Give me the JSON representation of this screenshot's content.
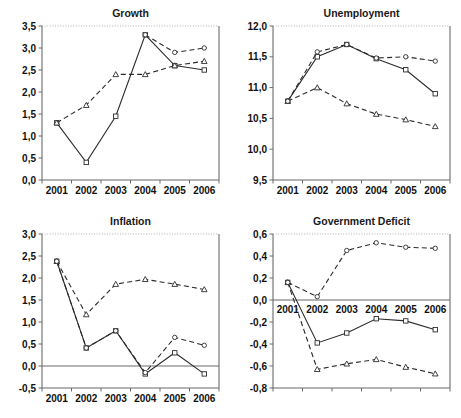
{
  "figure": {
    "background": "#ffffff",
    "line_color": "#2b2b2b",
    "axis_color": "#6b6b6b",
    "decimal_separator": ",",
    "layout": "2x2 grid of line charts"
  },
  "chart_data": [
    {
      "type": "line",
      "title": "Growth",
      "xlabel": "",
      "ylabel": "",
      "x": [
        "2001",
        "2002",
        "2003",
        "2004",
        "2005",
        "2006"
      ],
      "categories": [
        "2001",
        "2002",
        "2003",
        "2004",
        "2005",
        "2006"
      ],
      "ylim": [
        0.0,
        3.5
      ],
      "yticks": [
        0.0,
        0.5,
        1.0,
        1.5,
        2.0,
        2.5,
        3.0,
        3.5
      ],
      "ytick_labels": [
        "0,0",
        "0,5",
        "1,0",
        "1,5",
        "2,0",
        "2,5",
        "3,0",
        "3,5"
      ],
      "grid": false,
      "legend": "none",
      "series": [
        {
          "name": "series-solid-square",
          "style": "solid",
          "marker": "square",
          "values": [
            1.3,
            0.4,
            1.45,
            3.3,
            2.6,
            2.5
          ]
        },
        {
          "name": "series-dashed-triangle",
          "style": "dashed",
          "marker": "triangle",
          "values": [
            1.3,
            1.7,
            2.4,
            2.4,
            2.6,
            2.7
          ]
        },
        {
          "name": "series-dashed-circle",
          "style": "dashed",
          "marker": "circle",
          "values": [
            null,
            null,
            null,
            3.3,
            2.9,
            3.0
          ]
        }
      ]
    },
    {
      "type": "line",
      "title": "Unemployment",
      "xlabel": "",
      "ylabel": "",
      "x": [
        "2001",
        "2002",
        "2003",
        "2004",
        "2005",
        "2006"
      ],
      "categories": [
        "2001",
        "2002",
        "2003",
        "2004",
        "2005",
        "2006"
      ],
      "ylim": [
        9.5,
        12.0
      ],
      "yticks": [
        9.5,
        10.0,
        10.5,
        11.0,
        11.5,
        12.0
      ],
      "ytick_labels": [
        "9,5",
        "10,0",
        "10,5",
        "11,0",
        "11,5",
        "12,0"
      ],
      "grid": false,
      "legend": "none",
      "series": [
        {
          "name": "series-solid-square",
          "style": "solid",
          "marker": "square",
          "values": [
            10.78,
            11.5,
            11.7,
            11.47,
            11.29,
            10.9
          ]
        },
        {
          "name": "series-dashed-triangle",
          "style": "dashed",
          "marker": "triangle",
          "values": [
            10.78,
            11.0,
            10.74,
            10.57,
            10.48,
            10.37
          ]
        },
        {
          "name": "series-dashed-circle",
          "style": "dashed",
          "marker": "circle",
          "values": [
            10.78,
            11.58,
            11.7,
            11.48,
            11.5,
            11.43
          ]
        }
      ]
    },
    {
      "type": "line",
      "title": "Inflation",
      "xlabel": "",
      "ylabel": "",
      "x": [
        "2001",
        "2002",
        "2003",
        "2004",
        "2005",
        "2006"
      ],
      "categories": [
        "2001",
        "2002",
        "2003",
        "2004",
        "2005",
        "2006"
      ],
      "ylim": [
        -0.5,
        3.0
      ],
      "yticks": [
        -0.5,
        0.0,
        0.5,
        1.0,
        1.5,
        2.0,
        2.5,
        3.0
      ],
      "ytick_labels": [
        "-0,5",
        "0,0",
        "0,5",
        "1,0",
        "1,5",
        "2,0",
        "2,5",
        "3,0"
      ],
      "grid": false,
      "legend": "none",
      "zero_line": 0.0,
      "series": [
        {
          "name": "series-solid-square",
          "style": "solid",
          "marker": "square",
          "values": [
            2.38,
            0.41,
            0.8,
            -0.18,
            0.3,
            -0.18
          ]
        },
        {
          "name": "series-dashed-triangle",
          "style": "dashed",
          "marker": "triangle",
          "values": [
            2.38,
            1.17,
            1.86,
            1.97,
            1.86,
            1.74
          ]
        },
        {
          "name": "series-dashed-circle",
          "style": "dashed",
          "marker": "circle",
          "values": [
            2.38,
            0.41,
            0.8,
            -0.15,
            0.65,
            0.47
          ]
        }
      ]
    },
    {
      "type": "line",
      "title": "Government Deficit",
      "xlabel": "",
      "ylabel": "",
      "x": [
        "2001",
        "2002",
        "2003",
        "2004",
        "2005",
        "2006"
      ],
      "categories": [
        "2001",
        "2002",
        "2003",
        "2004",
        "2005",
        "2006"
      ],
      "ylim": [
        -0.8,
        0.6
      ],
      "yticks": [
        -0.8,
        -0.6,
        -0.4,
        -0.2,
        0.0,
        0.2,
        0.4,
        0.6
      ],
      "ytick_labels": [
        "-0,8",
        "-0,6",
        "-0,4",
        "-0,2",
        "0,0",
        "0,2",
        "0,4",
        "0,6"
      ],
      "grid": false,
      "legend": "none",
      "zero_line": 0.0,
      "series": [
        {
          "name": "series-solid-square",
          "style": "solid",
          "marker": "square",
          "values": [
            0.16,
            -0.39,
            -0.3,
            -0.17,
            -0.19,
            -0.27
          ]
        },
        {
          "name": "series-dashed-triangle",
          "style": "dashed",
          "marker": "triangle",
          "values": [
            0.16,
            -0.63,
            -0.58,
            -0.54,
            -0.61,
            -0.67
          ]
        },
        {
          "name": "series-dashed-circle",
          "style": "dashed",
          "marker": "circle",
          "values": [
            0.16,
            0.03,
            0.45,
            0.52,
            0.48,
            0.47
          ]
        }
      ]
    }
  ]
}
